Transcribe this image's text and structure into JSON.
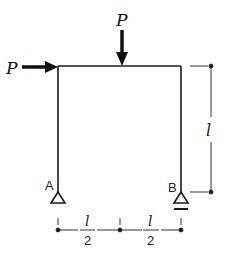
{
  "diagram": {
    "type": "portal frame structural diagram",
    "loads": [
      {
        "label": "P",
        "direction": "right",
        "location": "top-left corner"
      },
      {
        "label": "P",
        "direction": "down",
        "location": "midspan of beam"
      }
    ],
    "supports": [
      {
        "label": "A",
        "type": "pin"
      },
      {
        "label": "B",
        "type": "roller"
      }
    ],
    "dimensions": {
      "height": "l",
      "span_left": {
        "num": "l",
        "den": "2"
      },
      "span_right": {
        "num": "l",
        "den": "2"
      }
    },
    "colors": {
      "line": "#1a1a1a",
      "dim": "#333333"
    }
  }
}
